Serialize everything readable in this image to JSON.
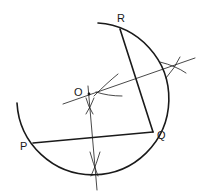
{
  "diagram": {
    "stroke_color": "#1a1a1a",
    "background": "#ffffff",
    "points": [
      {
        "id": "R",
        "label": "R",
        "x": 120,
        "y": 29,
        "label_x": 117,
        "label_y": 22
      },
      {
        "id": "Q",
        "label": "Q",
        "x": 153,
        "y": 132,
        "label_x": 157,
        "label_y": 139
      },
      {
        "id": "P",
        "label": "P",
        "x": 33,
        "y": 143,
        "label_x": 20,
        "label_y": 150
      },
      {
        "id": "O",
        "label": "O",
        "x": 89,
        "y": 94,
        "label_x": 74,
        "label_y": 96
      }
    ],
    "segments": [
      {
        "name": "segment-RQ",
        "from": "R",
        "to": "Q"
      },
      {
        "name": "segment-PQ",
        "from": "P",
        "to": "Q"
      }
    ],
    "bisectors": [
      {
        "name": "perpendicular-bisector-QR",
        "x1": 63,
        "y1": 104,
        "x2": 195,
        "y2": 58
      },
      {
        "name": "perpendicular-bisector-PQ",
        "x1": 88,
        "y1": 86,
        "x2": 97,
        "y2": 190
      }
    ],
    "circumcircle_arc": {
      "center_x": 89,
      "center_y": 94,
      "radius": 76
    }
  }
}
